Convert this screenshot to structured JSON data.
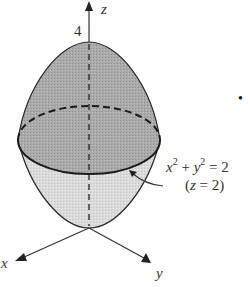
{
  "figure": {
    "colors": {
      "upper_fill": "#a9a9a9",
      "lower_fill": "#d9d9d9",
      "stroke": "#1a1a1a",
      "axis": "#333333"
    },
    "axes": {
      "z_label": "z",
      "x_label": "x",
      "y_label": "y",
      "z_tick_label": "4"
    },
    "annotation": {
      "equation_x": "x",
      "equation_x_exp": "2",
      "equation_plus": " + ",
      "equation_y": "y",
      "equation_y_exp": "2",
      "equation_rhs": " = 2",
      "condition_open": "(",
      "condition_var": "z",
      "condition_rest": " = 2)"
    },
    "marker": "•"
  }
}
